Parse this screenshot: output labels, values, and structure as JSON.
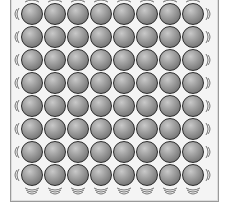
{
  "figure": {
    "type": "particle-lattice-illustration",
    "rows": 8,
    "columns": 8,
    "particle_color": "#8a8a8a",
    "outline_color": "#2b2b2b",
    "vibration_marks": [
      "top-row",
      "left-column",
      "right-column",
      "bottom-row"
    ]
  },
  "caption": {
    "text": ""
  }
}
